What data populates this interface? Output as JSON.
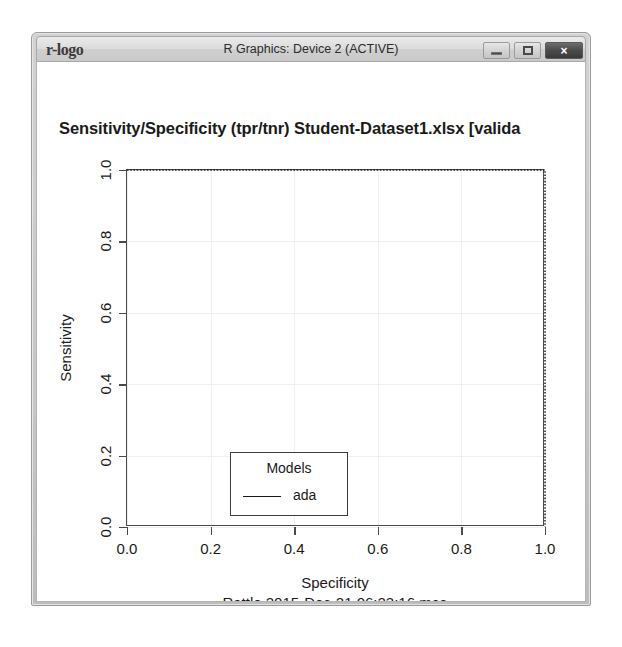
{
  "window": {
    "title": "R Graphics: Device 2 (ACTIVE)",
    "app_icon": "r-logo",
    "controls": {
      "minimize": "minimize-icon",
      "maximize": "maximize-icon",
      "close": "×"
    }
  },
  "chart_data": {
    "type": "line",
    "title": "Sensitivity/Specificity (tpr/tnr)  Student-Dataset1.xlsx [valida",
    "title_full_clipped": true,
    "xlabel": "Specificity",
    "ylabel": "Sensitivity",
    "xlim": [
      0.0,
      1.0
    ],
    "ylim": [
      0.0,
      1.0
    ],
    "xticks": [
      "0.0",
      "0.2",
      "0.4",
      "0.6",
      "0.8",
      "1.0"
    ],
    "xtick_values": [
      0.0,
      0.2,
      0.4,
      0.6,
      0.8,
      1.0
    ],
    "yticks": [
      "0.0",
      "0.2",
      "0.4",
      "0.6",
      "0.8",
      "1.0"
    ],
    "ytick_values": [
      0.0,
      0.2,
      0.4,
      0.6,
      0.8,
      1.0
    ],
    "grid": true,
    "grid_color": "#f0f0f0",
    "line_style": "dotted",
    "line_color": "#1a1a1a",
    "series": [
      {
        "name": "ada",
        "x": [
          0.0,
          1.0,
          1.0
        ],
        "y": [
          1.0,
          1.0,
          0.0
        ]
      }
    ],
    "legend": {
      "title": "Models",
      "position": "bottom-left",
      "entries": [
        {
          "label": "ada",
          "marker": "line",
          "color": "#1a1a1a"
        }
      ]
    },
    "annotation": "Rattle 2015-Dec-21 06:23:16 mca"
  },
  "colors": {
    "axis": "#4a4a4a",
    "text": "#1a1a1a",
    "grid": "#f0f0f0",
    "window_chrome": "#c9c9c9",
    "canvas": "#ffffff"
  }
}
